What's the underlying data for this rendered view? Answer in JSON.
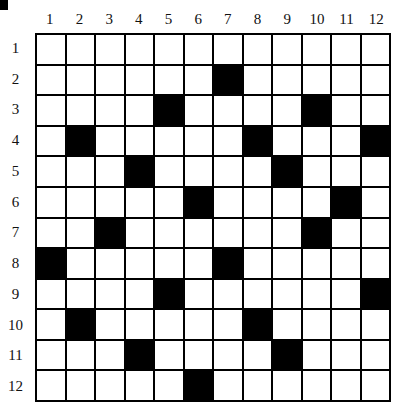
{
  "puzzle": {
    "rows": 12,
    "cols": 12,
    "column_labels": [
      "1",
      "2",
      "3",
      "4",
      "5",
      "6",
      "7",
      "8",
      "9",
      "10",
      "11",
      "12"
    ],
    "row_labels": [
      "1",
      "2",
      "3",
      "4",
      "5",
      "6",
      "7",
      "8",
      "9",
      "10",
      "11",
      "12"
    ],
    "black_cells": [
      [
        2,
        7
      ],
      [
        3,
        5
      ],
      [
        3,
        10
      ],
      [
        4,
        2
      ],
      [
        4,
        8
      ],
      [
        4,
        12
      ],
      [
        5,
        4
      ],
      [
        5,
        9
      ],
      [
        6,
        6
      ],
      [
        6,
        11
      ],
      [
        7,
        3
      ],
      [
        7,
        10
      ],
      [
        8,
        1
      ],
      [
        8,
        7
      ],
      [
        9,
        5
      ],
      [
        9,
        12
      ],
      [
        10,
        2
      ],
      [
        10,
        8
      ],
      [
        11,
        4
      ],
      [
        11,
        9
      ],
      [
        12,
        6
      ]
    ],
    "colors": {
      "black": "#000000",
      "white": "#ffffff"
    }
  }
}
